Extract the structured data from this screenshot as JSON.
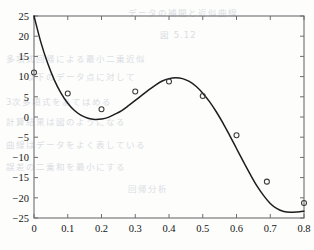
{
  "figure": {
    "background_color": "#fdfdfc",
    "axis_color": "#6d6d70",
    "curve_color": "#1d1d1f",
    "marker_color": "#3a3a3c"
  },
  "background_text": [
    "データの補間と近似曲線",
    "図 5.12",
    "多項式回帰による最小二乗近似",
    "以下のデータ点に対して",
    "3次多項式をあてはめる",
    "計算結果は図のようになる",
    "曲線はデータをよく表している",
    "誤差の二乗和を最小にする",
    "回帰分析"
  ],
  "chart_data": {
    "type": "line",
    "title": "",
    "subtitle": "",
    "xlabel": "",
    "ylabel": "",
    "xlim": [
      0,
      0.8
    ],
    "ylim": [
      -25,
      25
    ],
    "grid": false,
    "legend": null,
    "x_ticks": [
      0,
      0.1,
      0.2,
      0.3,
      0.4,
      0.5,
      0.6,
      0.7,
      0.8
    ],
    "x_ticklabels": [
      "0",
      "0.1",
      "0.2",
      "0.3",
      "0.4",
      "0.5",
      "0.6",
      "0.7",
      "0.8"
    ],
    "y_ticks": [
      -25,
      -20,
      -15,
      -10,
      -5,
      0,
      5,
      10,
      15,
      20,
      25
    ],
    "y_ticklabels": [
      "-25",
      "-20",
      "-15",
      "-10",
      "-5",
      "0",
      "5",
      "10",
      "15",
      "20",
      "25"
    ],
    "series": [
      {
        "name": "fitted curve",
        "style": "line",
        "x": [
          0.0,
          0.02,
          0.04,
          0.06,
          0.08,
          0.1,
          0.12,
          0.14,
          0.16,
          0.18,
          0.2,
          0.22,
          0.24,
          0.26,
          0.28,
          0.3,
          0.32,
          0.34,
          0.36,
          0.38,
          0.4,
          0.42,
          0.44,
          0.46,
          0.48,
          0.5,
          0.52,
          0.54,
          0.56,
          0.58,
          0.6,
          0.62,
          0.64,
          0.66,
          0.68,
          0.7,
          0.72,
          0.74,
          0.76,
          0.78,
          0.8
        ],
        "y": [
          25.0,
          18.6,
          13.4,
          9.2,
          5.9,
          3.4,
          1.6,
          0.4,
          -0.3,
          -0.6,
          -0.5,
          -0.1,
          0.7,
          1.6,
          2.8,
          4.1,
          5.4,
          6.7,
          7.9,
          8.9,
          9.5,
          9.7,
          9.5,
          8.8,
          7.6,
          5.9,
          3.8,
          1.3,
          -1.5,
          -4.6,
          -7.8,
          -11.0,
          -14.1,
          -17.0,
          -19.4,
          -21.4,
          -22.7,
          -23.4,
          -23.6,
          -23.5,
          -23.3
        ]
      },
      {
        "name": "data points",
        "style": "markers",
        "marker": "circle-open",
        "x": [
          0.0,
          0.1,
          0.2,
          0.3,
          0.4,
          0.5,
          0.6,
          0.69,
          0.8
        ],
        "y": [
          11.0,
          5.8,
          1.9,
          6.3,
          8.8,
          5.2,
          -4.5,
          -16.0,
          -21.3
        ]
      }
    ]
  }
}
